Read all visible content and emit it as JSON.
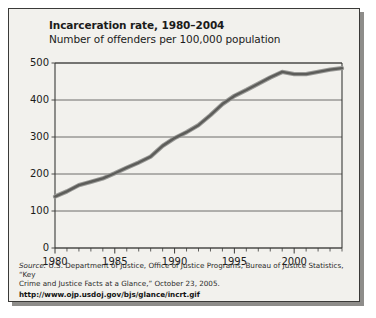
{
  "chart_data": {
    "type": "line",
    "title": "Incarceration rate, 1980–2004",
    "subtitle": "Number of offenders per 100,000 population",
    "xlabel": "",
    "ylabel": "",
    "ylim": [
      0,
      500
    ],
    "xlim": [
      1980,
      2004
    ],
    "yticks": [
      0,
      100,
      200,
      300,
      400,
      500
    ],
    "ytick_labels": [
      "0",
      "100",
      "200",
      "300",
      "400",
      "500"
    ],
    "xticks": [
      1980,
      1985,
      1990,
      1995,
      2000
    ],
    "xtick_labels": [
      "1980",
      "1985",
      "1990",
      "1995",
      "2000"
    ],
    "minor_xticks_every": 1,
    "grid": "horizontal",
    "legend": "none",
    "line_color": "#6e6e6e",
    "line_edge_color": "#3c3c3c",
    "x": [
      1980,
      1981,
      1982,
      1983,
      1984,
      1985,
      1986,
      1987,
      1988,
      1989,
      1990,
      1991,
      1992,
      1993,
      1994,
      1995,
      1996,
      1997,
      1998,
      1999,
      2000,
      2001,
      2002,
      2003,
      2004
    ],
    "values": [
      139,
      153,
      170,
      179,
      188,
      202,
      217,
      231,
      247,
      276,
      297,
      313,
      332,
      359,
      389,
      411,
      427,
      444,
      461,
      476,
      470,
      470,
      476,
      482,
      486
    ],
    "series": [
      {
        "name": "Incarceration rate per 100,000 population",
        "values": [
          139,
          153,
          170,
          179,
          188,
          202,
          217,
          231,
          247,
          276,
          297,
          313,
          332,
          359,
          389,
          411,
          427,
          444,
          461,
          476,
          470,
          470,
          476,
          482,
          486
        ]
      }
    ]
  },
  "source": {
    "line1_lead": "Source:",
    "line1": " U.S. Department of Justice, Office of Justice Programs, Bureau of Justice Statistics, “Key",
    "line2": "Crime and Justice Facts at a Glance,” October 23, 2005.",
    "url": "http://www.ojp.usdoj.gov/bjs/glance/incrt.gif"
  }
}
